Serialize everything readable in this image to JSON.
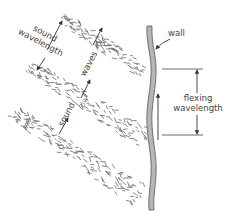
{
  "diagram": {
    "labels": {
      "wall": "wall",
      "sound_wavelength_line1": "sound",
      "sound_wavelength_line2": "wavelength",
      "sound_waves_part1": "sound",
      "sound_waves_part2": "waves",
      "flexing_wavelength_line1": "flexing",
      "flexing_wavelength_line2": "wavelength"
    },
    "elements": {
      "wave_bands": [
        "wavefront-1",
        "wavefront-2",
        "wavefront-3"
      ],
      "wall": "wavy flexing wall (hatched)",
      "dimension_sound_wavelength": "distance between successive wavefronts",
      "dimension_flexing_wavelength": "distance between successive wall flexures",
      "wall_motion_arrow": "upward"
    },
    "colors": {
      "ink": "#444444",
      "wall_fill": "#9a9a9a",
      "dash": "#6a6a6a",
      "background": "#ffffff"
    }
  }
}
